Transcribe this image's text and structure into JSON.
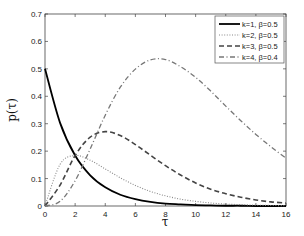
{
  "chart_data": {
    "type": "line",
    "title": "",
    "xlabel": "τ",
    "ylabel": "p(τ)",
    "xlim": [
      0,
      16
    ],
    "ylim": [
      0,
      0.7
    ],
    "grid": false,
    "legend_position": "upper right",
    "x_ticks": [
      "0",
      "2",
      "4",
      "6",
      "8",
      "10",
      "12",
      "14",
      "16"
    ],
    "y_ticks": [
      "0",
      "0.1",
      "0.2",
      "0.3",
      "0.4",
      "0.5",
      "0.6",
      "0.7"
    ],
    "x": [
      0,
      1,
      2,
      3,
      4,
      5,
      6,
      7,
      8,
      9,
      10,
      11,
      12,
      13,
      14,
      15,
      16
    ],
    "series": [
      {
        "name": "k=1, β=0.5",
        "style": "solid",
        "color": "#000000",
        "values": [
          0.5,
          0.303,
          0.184,
          0.112,
          0.068,
          0.041,
          0.025,
          0.015,
          0.009,
          0.006,
          0.003,
          0.002,
          0.001,
          0.001,
          0.0,
          0.0,
          0.0
        ]
      },
      {
        "name": "k=2, β=0.5",
        "style": "dotted",
        "color": "#888888",
        "values": [
          0.0,
          0.152,
          0.184,
          0.167,
          0.135,
          0.103,
          0.075,
          0.053,
          0.037,
          0.025,
          0.017,
          0.011,
          0.007,
          0.005,
          0.003,
          0.002,
          0.001
        ]
      },
      {
        "name": "k=3, β=0.5",
        "style": "dashed",
        "color": "#444444",
        "values": [
          0.0,
          0.076,
          0.184,
          0.251,
          0.271,
          0.257,
          0.224,
          0.185,
          0.147,
          0.113,
          0.084,
          0.061,
          0.045,
          0.032,
          0.022,
          0.015,
          0.011
        ]
      },
      {
        "name": "k=4, β=0.4",
        "style": "dashdot",
        "color": "#777777",
        "values": [
          0.0,
          0.017,
          0.092,
          0.208,
          0.331,
          0.433,
          0.499,
          0.533,
          0.534,
          0.508,
          0.469,
          0.419,
          0.364,
          0.311,
          0.261,
          0.216,
          0.174
        ]
      }
    ]
  },
  "legend": {
    "items": [
      {
        "label": "k=1, β=0.5"
      },
      {
        "label": "k=2, β=0.5"
      },
      {
        "label": "k=3, β=0.5"
      },
      {
        "label": "k=4, β=0.4"
      }
    ]
  }
}
